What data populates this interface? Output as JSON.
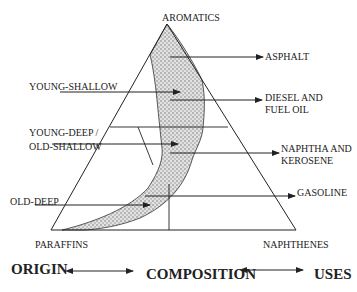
{
  "diagram": {
    "vertices": {
      "top": "AROMATICS",
      "left": "PARAFFINS",
      "right": "NAPHTHENES"
    },
    "origin_labels": [
      {
        "id": "young_shallow",
        "text": "YOUNG-SHALLOW"
      },
      {
        "id": "young_deep_old_shallow_1",
        "text": "YOUNG-DEEP /"
      },
      {
        "id": "young_deep_old_shallow_2",
        "text": "OLD-SHALLOW"
      },
      {
        "id": "old_deep",
        "text": "OLD-DEEP"
      }
    ],
    "use_labels": [
      {
        "id": "asphalt",
        "lines": [
          "ASPHALT"
        ]
      },
      {
        "id": "diesel",
        "lines": [
          "DIESEL AND",
          "FUEL OIL"
        ]
      },
      {
        "id": "naphtha",
        "lines": [
          "NAPHTHA AND",
          "KEROSENE"
        ]
      },
      {
        "id": "gasoline",
        "lines": [
          "GASOLINE"
        ]
      }
    ],
    "footer": {
      "origin": "ORIGIN",
      "composition": "COMPOSITION",
      "uses": "USES"
    },
    "colors": {
      "line": "#222222",
      "band_fill": "#d6d6d6",
      "background": "#ffffff"
    }
  }
}
